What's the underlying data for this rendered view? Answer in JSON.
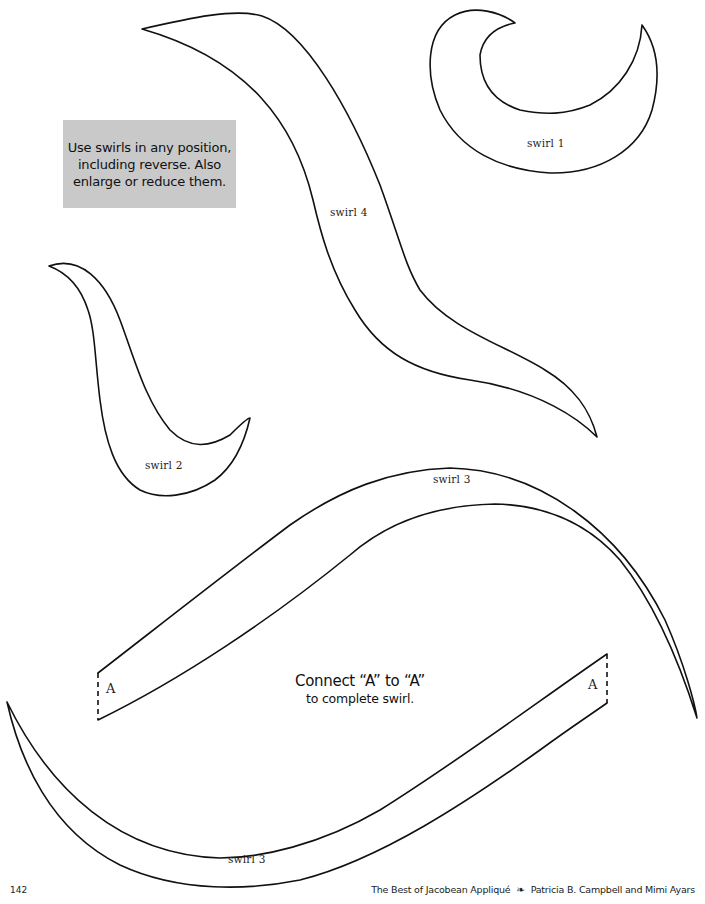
{
  "page": {
    "background": "#ffffff",
    "outline_color": "#111111"
  },
  "note_box": {
    "lines": [
      "Use swirls in any position,",
      "including reverse. Also",
      "enlarge or reduce them."
    ],
    "fill": "#c9c9c9"
  },
  "shapes": {
    "swirl1": {
      "label": "swirl 1"
    },
    "swirl2": {
      "label": "swirl 2"
    },
    "swirl3_upper": {
      "label": "swirl 3",
      "join_mark": "A"
    },
    "swirl3_lower": {
      "label": "swirl 3",
      "join_mark": "A"
    },
    "swirl4": {
      "label": "swirl 4"
    }
  },
  "instruction": {
    "line1": "Connect “A” to “A”",
    "line2": "to complete swirl."
  },
  "footer": {
    "page_number": "142",
    "book_title": "The Best of Jacobean Appliqué",
    "ornament": "❧",
    "authors": "Patricia B. Campbell and Mimi Ayars"
  }
}
